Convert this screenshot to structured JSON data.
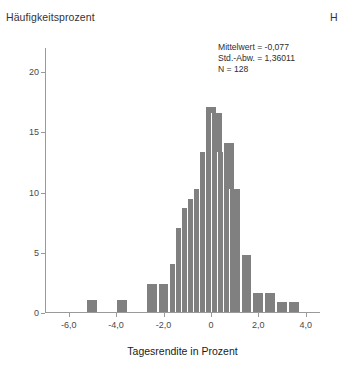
{
  "y_axis_title": "Häufigkeitsprozent",
  "edge_clipped_label": "H",
  "x_axis_title": "Tagesrendite in Prozent",
  "statistics": {
    "mean_line": "Mittelwert = -0,077",
    "stddev_line": "Std.-Abw. = 1,36011",
    "n_line": "N = 128"
  },
  "colors": {
    "bar_fill": "#808080",
    "axis_line": "#9a9a9a",
    "text": "#333333"
  },
  "chart_data": {
    "type": "bar",
    "title": "",
    "subtitle": "",
    "xlabel": "Tagesrendite in Prozent",
    "ylabel": "Häufigkeitsprozent",
    "xlim": [
      -7.0,
      4.6
    ],
    "ylim": [
      0,
      22
    ],
    "grid": false,
    "legend": null,
    "x_tick_labels": [
      "-6,0",
      "-4,0",
      "-2,0",
      "0",
      "2,0",
      "4,0"
    ],
    "x_tick_values": [
      -6.0,
      -4.0,
      -2.0,
      0,
      2.0,
      4.0
    ],
    "y_tick_labels": [
      "0",
      "5",
      "10",
      "15",
      "20"
    ],
    "y_tick_values": [
      0,
      5,
      10,
      15,
      20
    ],
    "bin_width": 0.5,
    "bin_centers": [
      -5.0,
      -3.75,
      -2.5,
      -2.0,
      -1.5,
      -1.25,
      -1.0,
      -0.75,
      -0.5,
      -0.25,
      0.0,
      0.25,
      0.5,
      0.75,
      1.0,
      1.5,
      2.0,
      2.5,
      3.0,
      3.5
    ],
    "categories": [
      "-5,0",
      "-3,75",
      "-2,5",
      "-2,0",
      "-1,5",
      "-1,25",
      "-1,0",
      "-0,75",
      "-0,5",
      "-0,25",
      "0,0",
      "0,25",
      "0,5",
      "0,75",
      "1,0",
      "1,5",
      "2,0",
      "2,5",
      "3,0",
      "3,5"
    ],
    "values": [
      1,
      1,
      2.3,
      2.3,
      4,
      7,
      8.6,
      9.4,
      10.2,
      13.3,
      17,
      16.5,
      13.3,
      14,
      10.2,
      4.7,
      1.6,
      1.6,
      0.8,
      0.8
    ],
    "annotations": [
      "Mittelwert = -0,077",
      "Std.-Abw. = 1,36011",
      "N = 128"
    ],
    "summary_stats": {
      "mean": -0.077,
      "std_dev": 1.36011,
      "n": 128
    }
  }
}
